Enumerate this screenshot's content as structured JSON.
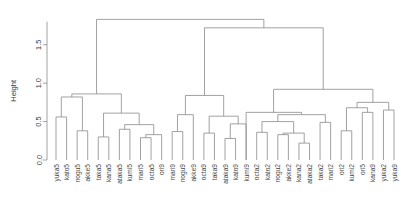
{
  "chart_data": {
    "type": "dendrogram",
    "title": "",
    "xlabel": "",
    "ylabel": "Height",
    "ylim": [
      0.0,
      1.9
    ],
    "yticks": [
      "0.0",
      "0.5",
      "1.0",
      "1.5"
    ],
    "ytick_values": [
      0.0,
      0.5,
      1.0,
      1.5
    ],
    "grid": false,
    "legend": "none",
    "line_color": "#8a8a8a",
    "n_leaves": 38,
    "leaf_order": [
      "yuka5",
      "kato5",
      "nogu5",
      "akke5",
      "taka5",
      "kana5",
      "ataka5",
      "kumi5",
      "mari5",
      "octa5",
      "ori9",
      "mari9",
      "nogu9",
      "akke9",
      "octa9",
      "taka9",
      "ataka9",
      "kato9",
      "kumi9",
      "octa2",
      "kato2",
      "nogu2",
      "akke2",
      "kana2",
      "ataka2",
      "taka2",
      "mari2",
      "ori2",
      "kumi2",
      "ori5",
      "kana9",
      "yuka2",
      "yuka9"
    ],
    "leaves": [
      {
        "label": "yuka5",
        "x": 1
      },
      {
        "label": "kato5",
        "x": 2
      },
      {
        "label": "nogu5",
        "x": 3
      },
      {
        "label": "akke5",
        "x": 4
      },
      {
        "label": "taka5",
        "x": 5
      },
      {
        "label": "kana5",
        "x": 6
      },
      {
        "label": "ataka5",
        "x": 7
      },
      {
        "label": "kumi5",
        "x": 8
      },
      {
        "label": "mari5",
        "x": 9
      },
      {
        "label": "octa5",
        "x": 10
      },
      {
        "label": "ori9",
        "x": 11
      },
      {
        "label": "mari9",
        "x": 12
      },
      {
        "label": "nogu9",
        "x": 13
      },
      {
        "label": "akke9",
        "x": 14
      },
      {
        "label": "octa9",
        "x": 15
      },
      {
        "label": "taka9",
        "x": 16
      },
      {
        "label": "ataka9",
        "x": 17
      },
      {
        "label": "kato9",
        "x": 18
      },
      {
        "label": "kumi9",
        "x": 19
      },
      {
        "label": "octa2",
        "x": 20
      },
      {
        "label": "kato2",
        "x": 21
      },
      {
        "label": "nogu2",
        "x": 22
      },
      {
        "label": "akke2",
        "x": 23
      },
      {
        "label": "kana2",
        "x": 24
      },
      {
        "label": "ataka2",
        "x": 25
      },
      {
        "label": "taka2",
        "x": 26
      },
      {
        "label": "mari2",
        "x": 27
      },
      {
        "label": "ori2",
        "x": 28
      },
      {
        "label": "kumi2",
        "x": 29
      },
      {
        "label": "ori5",
        "x": 30
      },
      {
        "label": "kana9",
        "x": 31
      },
      {
        "label": "yuka2",
        "x": 32
      },
      {
        "label": "yuka9",
        "x": 33
      }
    ],
    "merges": [
      {
        "id": "m1",
        "left": {
          "x": 1,
          "h": 0.0
        },
        "right": {
          "x": 2,
          "h": 0.0
        },
        "x": 1.5,
        "h": 0.56
      },
      {
        "id": "m2",
        "left": {
          "x": 3,
          "h": 0.0
        },
        "right": {
          "x": 4,
          "h": 0.0
        },
        "x": 3.5,
        "h": 0.38
      },
      {
        "id": "m3",
        "left": {
          "x": 1.5,
          "h": 0.56
        },
        "right": {
          "x": 3.5,
          "h": 0.38
        },
        "x": 2.5,
        "h": 0.82
      },
      {
        "id": "m4",
        "left": {
          "x": 5,
          "h": 0.0
        },
        "right": {
          "x": 6,
          "h": 0.0
        },
        "x": 5.5,
        "h": 0.3
      },
      {
        "id": "m5",
        "left": {
          "x": 7,
          "h": 0.0
        },
        "right": {
          "x": 8,
          "h": 0.0
        },
        "x": 7.5,
        "h": 0.4
      },
      {
        "id": "m6",
        "left": {
          "x": 9,
          "h": 0.0
        },
        "right": {
          "x": 10,
          "h": 0.0
        },
        "x": 9.5,
        "h": 0.29
      },
      {
        "id": "m7",
        "left": {
          "x": 9.5,
          "h": 0.29
        },
        "right": {
          "x": 11,
          "h": 0.0
        },
        "x": 10.25,
        "h": 0.33
      },
      {
        "id": "m8",
        "left": {
          "x": 7.5,
          "h": 0.4
        },
        "right": {
          "x": 10.25,
          "h": 0.33
        },
        "x": 8.875,
        "h": 0.46
      },
      {
        "id": "m9",
        "left": {
          "x": 5.5,
          "h": 0.3
        },
        "right": {
          "x": 8.875,
          "h": 0.46
        },
        "x": 7.1875,
        "h": 0.61
      },
      {
        "id": "m10",
        "left": {
          "x": 2.5,
          "h": 0.82
        },
        "right": {
          "x": 7.1875,
          "h": 0.61
        },
        "x": 4.84,
        "h": 0.86
      },
      {
        "id": "m11",
        "left": {
          "x": 12,
          "h": 0.0
        },
        "right": {
          "x": 13,
          "h": 0.0
        },
        "x": 12.5,
        "h": 0.37
      },
      {
        "id": "m12",
        "left": {
          "x": 14,
          "h": 0.0
        },
        "right": {
          "x": 12.5,
          "h": 0.37
        },
        "x": 13.25,
        "h": 0.59
      },
      {
        "id": "m13",
        "left": {
          "x": 15,
          "h": 0.0
        },
        "right": {
          "x": 16,
          "h": 0.0
        },
        "x": 15.5,
        "h": 0.35
      },
      {
        "id": "m14",
        "left": {
          "x": 17,
          "h": 0.0
        },
        "right": {
          "x": 18,
          "h": 0.0
        },
        "x": 17.5,
        "h": 0.28
      },
      {
        "id": "m15",
        "left": {
          "x": 17.5,
          "h": 0.28
        },
        "right": {
          "x": 19,
          "h": 0.0
        },
        "x": 18.25,
        "h": 0.47
      },
      {
        "id": "m16",
        "left": {
          "x": 15.5,
          "h": 0.35
        },
        "right": {
          "x": 18.25,
          "h": 0.47
        },
        "x": 16.875,
        "h": 0.57
      },
      {
        "id": "m17",
        "left": {
          "x": 13.25,
          "h": 0.59
        },
        "right": {
          "x": 16.875,
          "h": 0.57
        },
        "x": 15.06,
        "h": 0.84
      },
      {
        "id": "m18",
        "left": {
          "x": 20,
          "h": 0.0
        },
        "right": {
          "x": 21,
          "h": 0.0
        },
        "x": 20.5,
        "h": 0.36
      },
      {
        "id": "m19",
        "left": {
          "x": 22,
          "h": 0.0
        },
        "right": {
          "x": 23,
          "h": 0.0
        },
        "x": 22.5,
        "h": 0.33
      },
      {
        "id": "m20",
        "left": {
          "x": 24,
          "h": 0.0
        },
        "right": {
          "x": 25,
          "h": 0.0
        },
        "x": 24.5,
        "h": 0.22
      },
      {
        "id": "m21",
        "left": {
          "x": 22.5,
          "h": 0.33
        },
        "right": {
          "x": 24.5,
          "h": 0.22
        },
        "x": 23.5,
        "h": 0.35
      },
      {
        "id": "m22",
        "left": {
          "x": 20.5,
          "h": 0.36
        },
        "right": {
          "x": 23.5,
          "h": 0.35
        },
        "x": 22.0,
        "h": 0.5
      },
      {
        "id": "m23",
        "left": {
          "x": 26,
          "h": 0.0
        },
        "right": {
          "x": 27,
          "h": 0.0
        },
        "x": 26.5,
        "h": 0.49
      },
      {
        "id": "m24",
        "left": {
          "x": 22.0,
          "h": 0.5
        },
        "right": {
          "x": 26.5,
          "h": 0.49
        },
        "x": 24.25,
        "h": 0.59
      },
      {
        "id": "m25",
        "left": {
          "x": 19.0,
          "h": 0.0
        },
        "right": {
          "x": 24.25,
          "h": 0.59
        },
        "x": 21.6,
        "h": 0.62
      },
      {
        "id": "m26",
        "left": {
          "x": 28,
          "h": 0.0
        },
        "right": {
          "x": 29,
          "h": 0.0
        },
        "x": 28.5,
        "h": 0.38
      },
      {
        "id": "m27",
        "left": {
          "x": 30,
          "h": 0.0
        },
        "right": {
          "x": 31,
          "h": 0.0
        },
        "x": 30.5,
        "h": 0.62
      },
      {
        "id": "m28",
        "left": {
          "x": 28.5,
          "h": 0.38
        },
        "right": {
          "x": 30.5,
          "h": 0.62
        },
        "x": 29.5,
        "h": 0.68
      },
      {
        "id": "m29",
        "left": {
          "x": 32,
          "h": 0.0
        },
        "right": {
          "x": 33,
          "h": 0.0
        },
        "x": 32.5,
        "h": 0.65
      },
      {
        "id": "m30",
        "left": {
          "x": 29.5,
          "h": 0.68
        },
        "right": {
          "x": 32.5,
          "h": 0.65
        },
        "x": 31.0,
        "h": 0.75
      },
      {
        "id": "m31",
        "left": {
          "x": 21.6,
          "h": 0.62
        },
        "right": {
          "x": 31.0,
          "h": 0.75
        },
        "x": 26.3,
        "h": 0.92
      },
      {
        "id": "m32",
        "left": {
          "x": 15.06,
          "h": 0.84
        },
        "right": {
          "x": 26.3,
          "h": 0.92
        },
        "x": 20.68,
        "h": 1.72
      },
      {
        "id": "m33",
        "left": {
          "x": 4.84,
          "h": 0.86
        },
        "right": {
          "x": 20.68,
          "h": 1.72
        },
        "x": 12.76,
        "h": 1.83
      }
    ]
  },
  "axis": {
    "ylabel": "Height",
    "ticks": [
      {
        "label": "0.0",
        "value": 0.0
      },
      {
        "label": "0.5",
        "value": 0.5
      },
      {
        "label": "1.0",
        "value": 1.0
      },
      {
        "label": "1.5",
        "value": 1.5
      }
    ]
  }
}
